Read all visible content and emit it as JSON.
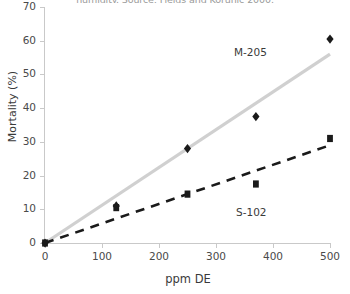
{
  "chart_data": {
    "type": "scatter",
    "title": "humidity. Source: Fields and Korunic 2000.",
    "xlabel": "ppm DE",
    "ylabel": "Mortality (%)",
    "xlim": [
      0,
      500
    ],
    "ylim": [
      0,
      70
    ],
    "xticks": [
      0,
      100,
      200,
      300,
      400,
      500
    ],
    "yticks": [
      0,
      10,
      20,
      30,
      40,
      50,
      60,
      70
    ],
    "grid": false,
    "legend_position": "inline-annotations",
    "series": [
      {
        "name": "M-205",
        "marker": "diamond",
        "color": "#1a1a1a",
        "trendline_color": "#d0d0d0",
        "trendline_style": "solid",
        "x": [
          0,
          125,
          250,
          370,
          500
        ],
        "values": [
          0,
          11,
          28,
          37.5,
          60.5
        ],
        "trendline_endpoints": [
          [
            0,
            0
          ],
          [
            500,
            56
          ]
        ]
      },
      {
        "name": "S-102",
        "marker": "square",
        "color": "#1a1a1a",
        "trendline_color": "#1a1a1a",
        "trendline_style": "dashed",
        "x": [
          0,
          125,
          250,
          370,
          500
        ],
        "values": [
          0,
          10.5,
          14.5,
          17.5,
          31
        ],
        "trendline_endpoints": [
          [
            0,
            0
          ],
          [
            500,
            29
          ]
        ]
      }
    ],
    "annotations": [
      {
        "text": "M-205",
        "x": 330,
        "y": 51
      },
      {
        "text": "S-102",
        "x": 336,
        "y": 8
      }
    ]
  },
  "axes": {
    "x_tick_labels": [
      "0",
      "100",
      "200",
      "300",
      "400",
      "500"
    ],
    "y_tick_labels": [
      "0",
      "10",
      "20",
      "30",
      "40",
      "50",
      "60",
      "70"
    ],
    "x_title": "ppm DE",
    "y_title": "Mortality (%)"
  },
  "labels": {
    "series_m205": "M-205",
    "series_s102": "S-102"
  },
  "colors": {
    "marker": "#1a1a1a",
    "trend_m205": "#d0d0d0",
    "trend_s102": "#1a1a1a",
    "axis": "#c9c9c9",
    "text": "#3a3a3a"
  }
}
